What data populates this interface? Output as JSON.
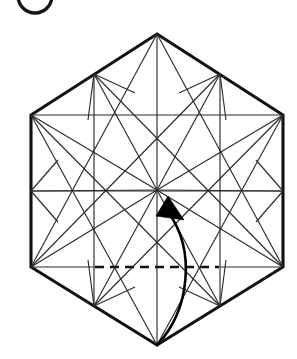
{
  "diagram": {
    "kind": "origami-crease-pattern",
    "canvas": {
      "width": 297,
      "height": 359
    },
    "colors": {
      "background": "#ffffff",
      "outline": "#111111",
      "crease": "#2b2b2b",
      "dashed_crease": "#111111",
      "arrow": "#000000"
    }
  },
  "step_badge": {
    "visible": true,
    "clipped_by_top_edge": true,
    "label": "",
    "center_x": 35,
    "center_y": -4,
    "radius": 17
  },
  "hexagon": {
    "name": "outer-hexagon",
    "description": "Regular hexagon with flat left and right vertical sides, apex at top and bottom",
    "vertices": [
      {
        "id": "top",
        "x": 157,
        "y": 34
      },
      {
        "id": "upper-right",
        "x": 283,
        "y": 115
      },
      {
        "id": "lower-right",
        "x": 283,
        "y": 267
      },
      {
        "id": "bottom",
        "x": 157,
        "y": 345
      },
      {
        "id": "lower-left",
        "x": 31,
        "y": 267
      },
      {
        "id": "upper-left",
        "x": 31,
        "y": 115
      }
    ],
    "center": {
      "x": 157,
      "y": 190
    },
    "edge_midpoints": [
      {
        "id": "mid-upper-left",
        "x": 94,
        "y": 74
      },
      {
        "id": "mid-upper-right",
        "x": 220,
        "y": 74
      },
      {
        "id": "mid-right",
        "x": 283,
        "y": 191
      },
      {
        "id": "mid-lower-right",
        "x": 220,
        "y": 306
      },
      {
        "id": "mid-lower-left",
        "x": 94,
        "y": 306
      },
      {
        "id": "mid-left",
        "x": 31,
        "y": 191
      }
    ]
  },
  "creases": {
    "spokes_from_center": [
      {
        "name": "spoke-center-top",
        "x1": 157,
        "y1": 190,
        "x2": 157,
        "y2": 34
      },
      {
        "name": "spoke-center-upper-right",
        "x1": 157,
        "y1": 190,
        "x2": 283,
        "y2": 115
      },
      {
        "name": "spoke-center-lower-right",
        "x1": 157,
        "y1": 190,
        "x2": 283,
        "y2": 267
      },
      {
        "name": "spoke-center-bottom",
        "x1": 157,
        "y1": 190,
        "x2": 157,
        "y2": 345
      },
      {
        "name": "spoke-center-lower-left",
        "x1": 157,
        "y1": 190,
        "x2": 31,
        "y2": 267
      },
      {
        "name": "spoke-center-upper-left",
        "x1": 157,
        "y1": 190,
        "x2": 31,
        "y2": 115
      },
      {
        "name": "spoke-center-mid-upper-left",
        "x1": 157,
        "y1": 190,
        "x2": 94,
        "y2": 74
      },
      {
        "name": "spoke-center-mid-upper-right",
        "x1": 157,
        "y1": 190,
        "x2": 220,
        "y2": 74
      },
      {
        "name": "spoke-center-mid-right",
        "x1": 157,
        "y1": 190,
        "x2": 283,
        "y2": 191
      },
      {
        "name": "spoke-center-mid-lower-right",
        "x1": 157,
        "y1": 190,
        "x2": 220,
        "y2": 306
      },
      {
        "name": "spoke-center-mid-lower-left",
        "x1": 157,
        "y1": 190,
        "x2": 94,
        "y2": 306
      },
      {
        "name": "spoke-center-mid-left",
        "x1": 157,
        "y1": 190,
        "x2": 31,
        "y2": 191
      }
    ],
    "long_chords": [
      {
        "name": "chord-upper-horizontal",
        "x1": 31,
        "y1": 115,
        "x2": 283,
        "y2": 115
      },
      {
        "name": "chord-mid-horizontal",
        "x1": 31,
        "y1": 191,
        "x2": 283,
        "y2": 191
      },
      {
        "name": "chord-lower-left-seg",
        "x1": 31,
        "y1": 267,
        "x2": 94,
        "y2": 267
      },
      {
        "name": "chord-lower-right-seg",
        "x1": 220,
        "y1": 267,
        "x2": 283,
        "y2": 267
      },
      {
        "name": "chord-ul-to-mur",
        "x1": 31,
        "y1": 115,
        "x2": 220,
        "y2": 306
      },
      {
        "name": "chord-ur-to-mul",
        "x1": 283,
        "y1": 115,
        "x2": 94,
        "y2": 306
      },
      {
        "name": "chord-ll-to-mur-top",
        "x1": 31,
        "y1": 267,
        "x2": 220,
        "y2": 74
      },
      {
        "name": "chord-lr-to-mul-top",
        "x1": 283,
        "y1": 267,
        "x2": 94,
        "y2": 74
      },
      {
        "name": "chord-top-to-ll",
        "x1": 157,
        "y1": 34,
        "x2": 31,
        "y2": 267
      },
      {
        "name": "chord-top-to-lr",
        "x1": 157,
        "y1": 34,
        "x2": 283,
        "y2": 267
      },
      {
        "name": "chord-bottom-to-ul",
        "x1": 157,
        "y1": 345,
        "x2": 31,
        "y2": 115
      },
      {
        "name": "chord-bottom-to-ur",
        "x1": 157,
        "y1": 345,
        "x2": 283,
        "y2": 115
      },
      {
        "name": "chord-mul-to-mll",
        "x1": 94,
        "y1": 74,
        "x2": 94,
        "y2": 306
      },
      {
        "name": "chord-mur-to-mlr",
        "x1": 220,
        "y1": 74,
        "x2": 220,
        "y2": 306
      }
    ],
    "edge_stubs": [
      {
        "name": "stub-mul-a",
        "x1": 94,
        "y1": 74,
        "x2": 88,
        "y2": 120
      },
      {
        "name": "stub-mul-b",
        "x1": 94,
        "y1": 74,
        "x2": 135,
        "y2": 93
      },
      {
        "name": "stub-mur-a",
        "x1": 220,
        "y1": 74,
        "x2": 226,
        "y2": 120
      },
      {
        "name": "stub-mur-b",
        "x1": 220,
        "y1": 74,
        "x2": 179,
        "y2": 93
      },
      {
        "name": "stub-mll-a",
        "x1": 94,
        "y1": 306,
        "x2": 88,
        "y2": 260
      },
      {
        "name": "stub-mll-b",
        "x1": 94,
        "y1": 306,
        "x2": 135,
        "y2": 287
      },
      {
        "name": "stub-mlr-a",
        "x1": 220,
        "y1": 306,
        "x2": 226,
        "y2": 260
      },
      {
        "name": "stub-mlr-b",
        "x1": 220,
        "y1": 306,
        "x2": 179,
        "y2": 287
      },
      {
        "name": "stub-mleft-up",
        "x1": 31,
        "y1": 191,
        "x2": 58,
        "y2": 160
      },
      {
        "name": "stub-mleft-down",
        "x1": 31,
        "y1": 191,
        "x2": 58,
        "y2": 222
      },
      {
        "name": "stub-mright-up",
        "x1": 283,
        "y1": 191,
        "x2": 256,
        "y2": 160
      },
      {
        "name": "stub-mright-down",
        "x1": 283,
        "y1": 191,
        "x2": 256,
        "y2": 222
      }
    ],
    "dashed_segment": {
      "name": "dashed-fold-line",
      "x1": 95,
      "y1": 267,
      "x2": 219,
      "y2": 267,
      "style": "dashed",
      "meaning": "hidden/reference fold line"
    }
  },
  "fold_arrow": {
    "name": "valley-fold-arrow",
    "from": {
      "x": 157,
      "y": 345
    },
    "to": {
      "x": 164,
      "y": 200
    },
    "curve_control": {
      "x": 196,
      "y": 276
    },
    "path": "M 157 345 C 190 310 196 250 168 212",
    "head": {
      "points": "168,196 184,220 156,216",
      "rotation_hint": "points toward hexagon center"
    },
    "meaning": "fold bottom vertex up to center"
  }
}
